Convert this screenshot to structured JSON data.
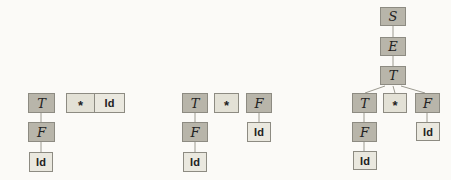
{
  "palette": {
    "node_fill": "#b8b5aa",
    "leaf_fill": "#eae8df",
    "star_fill": "#e3e1d6",
    "node_border": "#8d8b82",
    "edge": "#9c9a90",
    "text": "#222222",
    "bg": "#fbfaf7"
  },
  "g1": {
    "t": "T",
    "f": "F",
    "id": "Id",
    "star": "*",
    "star_id": "Id"
  },
  "g2": {
    "t": "T",
    "star": "*",
    "f_top": "F",
    "f": "F",
    "id": "Id",
    "id_right": "Id"
  },
  "g3": {
    "s": "S",
    "e": "E",
    "t_top": "T",
    "t": "T",
    "star": "*",
    "f_right": "F",
    "f": "F",
    "id": "Id",
    "id_right": "Id"
  }
}
